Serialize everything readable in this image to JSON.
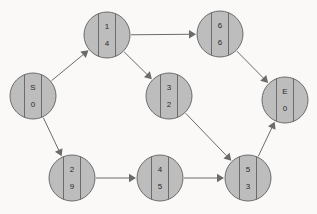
{
  "diagram": {
    "background_color": "#faf9f7",
    "node_fill_color": "#bdbdbd",
    "node_stroke_color": "#6b6b6b",
    "edge_color": "#6b6b6b",
    "text_color": "#2b2b2b",
    "node_radius": 23,
    "nodes": [
      {
        "id": "S",
        "label": "S",
        "value": "0",
        "cx": 33,
        "cy": 96
      },
      {
        "id": "1",
        "label": "1",
        "value": "4",
        "cx": 107,
        "cy": 35
      },
      {
        "id": "6",
        "label": "6",
        "value": "6",
        "cx": 220,
        "cy": 34
      },
      {
        "id": "3",
        "label": "3",
        "value": "2",
        "cx": 169,
        "cy": 96
      },
      {
        "id": "E",
        "label": "E",
        "value": "0",
        "cx": 285,
        "cy": 100
      },
      {
        "id": "2",
        "label": "2",
        "value": "9",
        "cx": 72,
        "cy": 178
      },
      {
        "id": "4",
        "label": "4",
        "value": "5",
        "cx": 160,
        "cy": 178
      },
      {
        "id": "5",
        "label": "5",
        "value": "3",
        "cx": 248,
        "cy": 178
      }
    ],
    "edges": [
      {
        "from": "S",
        "to": "1"
      },
      {
        "from": "S",
        "to": "2"
      },
      {
        "from": "1",
        "to": "6"
      },
      {
        "from": "1",
        "to": "3"
      },
      {
        "from": "6",
        "to": "E"
      },
      {
        "from": "3",
        "to": "5"
      },
      {
        "from": "2",
        "to": "4"
      },
      {
        "from": "4",
        "to": "5"
      },
      {
        "from": "5",
        "to": "E"
      }
    ]
  }
}
